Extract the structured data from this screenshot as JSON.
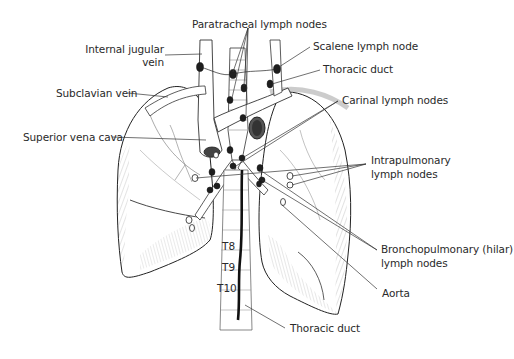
{
  "diagram": {
    "labels": {
      "paratracheal": "Paratracheal lymph nodes",
      "internal_jugular_1": "Internal jugular",
      "internal_jugular_2": "vein",
      "scalene": "Scalene lymph node",
      "thoracic_duct_top": "Thoracic duct",
      "subclavian": "Subclavian vein",
      "carinal": "Carinal lymph nodes",
      "svc": "Superior vena cava",
      "intrapulmonary_1": "Intrapulmonary",
      "intrapulmonary_2": "lymph nodes",
      "bronchopulmonary_1": "Bronchopulmonary (hilar)",
      "bronchopulmonary_2": "lymph nodes",
      "aorta": "Aorta",
      "thoracic_duct_bottom": "Thoracic duct"
    },
    "vertebrae": [
      "T8",
      "T9",
      "T10"
    ],
    "colors": {
      "ink": "#2a2a2a",
      "fill": "#ffffff",
      "node": "#1e1e1e",
      "shade": "#8a8a8a"
    }
  }
}
